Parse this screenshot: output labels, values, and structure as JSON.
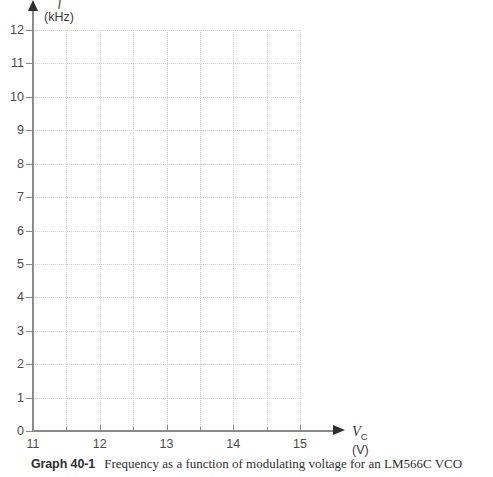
{
  "figure": {
    "caption_label": "Graph 40-1",
    "caption_text": "Frequency as a function of modulating voltage for an LM566C VCO",
    "axis_color": "#8a8a8a",
    "grid_color": "#d2d2d2",
    "background": "#ffffff"
  },
  "y_axis": {
    "symbol": "f",
    "unit": "(kHz)",
    "tick_labels": [
      "0",
      "1",
      "2",
      "3",
      "4",
      "5",
      "6",
      "7",
      "8",
      "9",
      "10",
      "11",
      "12"
    ]
  },
  "x_axis": {
    "symbol": "V",
    "symbol_sub": "C",
    "unit": "(V)",
    "tick_labels": [
      "11",
      "12",
      "13",
      "14",
      "15"
    ]
  },
  "chart_data": {
    "type": "line",
    "title": "Frequency as a function of modulating voltage for an LM566C VCO",
    "subtitle": "Graph 40-1",
    "xlabel": "V_C (V)",
    "ylabel": "f (kHz)",
    "xlim": [
      11,
      15
    ],
    "ylim": [
      0,
      12
    ],
    "x_major_ticks": [
      11,
      12,
      13,
      14,
      15
    ],
    "x_minor_ticks": [
      11.5,
      12.5,
      13.5,
      14.5
    ],
    "y_major_ticks": [
      0,
      1,
      2,
      3,
      4,
      5,
      6,
      7,
      8,
      9,
      10,
      11,
      12
    ],
    "x_gridlines": [
      11,
      11.5,
      12,
      12.5,
      13,
      13.5,
      14,
      14.5,
      15
    ],
    "y_gridlines": [
      0,
      1,
      2,
      3,
      4,
      5,
      6,
      7,
      8,
      9,
      10,
      11,
      12
    ],
    "grid": true,
    "grid_style": "dotted",
    "legend": null,
    "series": [],
    "values": [],
    "categories": [],
    "annotations": [],
    "note": "Blank worksheet grid — no data series plotted"
  }
}
